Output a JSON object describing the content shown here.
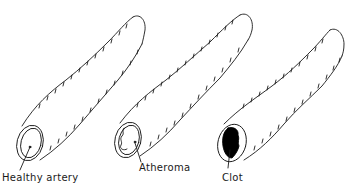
{
  "diagram": {
    "ink_color": "#1a1a1a",
    "background": "#ffffff",
    "arteries": [
      {
        "id": "healthy",
        "label": "Healthy artery",
        "lumen": "clear"
      },
      {
        "id": "atheroma",
        "label": "Atheroma",
        "lumen": "fatty deposit outline"
      },
      {
        "id": "clot",
        "label": "Clot",
        "lumen": "filled black clot"
      }
    ]
  }
}
